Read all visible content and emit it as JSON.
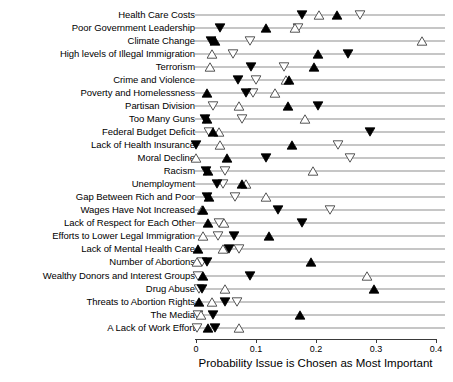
{
  "chart_data": {
    "type": "scatter",
    "title": "",
    "xlabel": "Probability Issue is Chosen as Most Important",
    "ylabel": "",
    "xlim": [
      0,
      0.4
    ],
    "xticks": [
      0,
      0.1,
      0.2,
      0.3,
      0.4
    ],
    "xtick_labels": [
      "0",
      "0.1",
      "0.2",
      "0.3",
      "0.4"
    ],
    "grid": false,
    "legend_position": "none",
    "marker_types": [
      "filled-up-triangle",
      "open-up-triangle",
      "filled-down-triangle",
      "open-down-triangle"
    ],
    "categories": [
      "Health Care Costs",
      "Poor Government Leadership",
      "Climate Change",
      "High levels of Illegal Immigration",
      "Terrorism",
      "Crime and Violence",
      "Poverty and Homelessness",
      "Partisan Division",
      "Too Many Guns",
      "Federal Budget Deficit",
      "Lack of Health Insurance",
      "Moral Decline",
      "Racism",
      "Unemployment",
      "Gap Between Rich and Poor",
      "Wages Have Not Increased",
      "Lack of Respect for Each Other",
      "Efforts to Lower Legal Immigration",
      "Lack of Mental Health Care",
      "Number of Abortions",
      "Wealthy Donors and Interest Groups",
      "Drug Abuse",
      "Threats to Abortion Rights",
      "The Media",
      "A Lack of Work Effort"
    ],
    "series": [
      {
        "name": "filled-up-triangle",
        "marker": "filled-up-triangle",
        "values": [
          0.235,
          0.117,
          0.032,
          0.203,
          0.197,
          0.155,
          0.018,
          0.153,
          0.019,
          0.028,
          0.16,
          0.052,
          0.02,
          0.077,
          0.022,
          0.012,
          0.02,
          0.122,
          0.003,
          0.192,
          0.012,
          0.297,
          0.005,
          0.173,
          0.02
        ]
      },
      {
        "name": "open-up-triangle",
        "marker": "open-up-triangle",
        "values": [
          0.205,
          0.165,
          0.377,
          0.027,
          0.023,
          0.15,
          0.132,
          0.072,
          0.182,
          0.038,
          0.04,
          0.0,
          0.195,
          0.083,
          0.117,
          0.01,
          0.047,
          0.012,
          0.045,
          0.002,
          0.285,
          0.048,
          0.027,
          0.008,
          0.072
        ]
      },
      {
        "name": "filled-down-triangle",
        "marker": "filled-down-triangle",
        "values": [
          0.177,
          0.04,
          0.025,
          0.253,
          0.092,
          0.07,
          0.083,
          0.203,
          0.015,
          0.29,
          0.0,
          0.117,
          0.017,
          0.035,
          0.018,
          0.137,
          0.177,
          0.063,
          0.055,
          0.018,
          0.09,
          0.01,
          0.048,
          0.028,
          0.032
        ]
      },
      {
        "name": "open-down-triangle",
        "marker": "open-down-triangle",
        "values": [
          0.273,
          0.17,
          0.09,
          0.062,
          0.147,
          0.1,
          0.095,
          0.028,
          0.077,
          0.022,
          0.237,
          0.257,
          0.048,
          0.045,
          0.065,
          0.223,
          0.038,
          0.037,
          0.072,
          0.01,
          0.003,
          0.005,
          0.068,
          0.003,
          0.002
        ]
      }
    ]
  }
}
